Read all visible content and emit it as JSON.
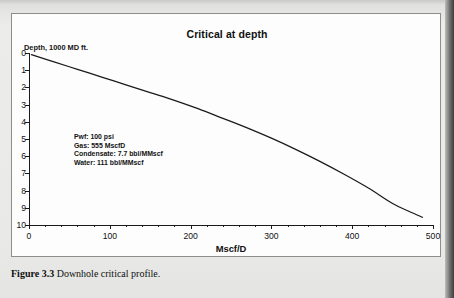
{
  "figure": {
    "caption_label": "Figure 3.3",
    "caption_text": "Downhole critical profile."
  },
  "chart_data": {
    "type": "line",
    "title": "Critical at depth",
    "xlabel": "Mscf/D",
    "ylabel": "Depth, 1000 MD ft.",
    "xlim": [
      0,
      500
    ],
    "ylim": [
      0,
      10
    ],
    "y_inverted": true,
    "grid": false,
    "legend": "none",
    "x_major_ticks": [
      0,
      100,
      200,
      300,
      400,
      500
    ],
    "x_tick_labels": [
      "0",
      "100",
      "200",
      "300",
      "400",
      "500"
    ],
    "x_minor_interval": 20,
    "y_ticks": [
      0,
      1,
      2,
      3,
      4,
      5,
      6,
      7,
      8,
      9,
      10
    ],
    "y_tick_labels": [
      "0",
      "1",
      "2",
      "3",
      "4",
      "5",
      "6",
      "7",
      "8",
      "9",
      "10"
    ],
    "series": [
      {
        "name": "Critical rate profile",
        "color": "#1a1a1a",
        "x": [
          3,
          30,
          60,
          90,
          120,
          150,
          180,
          210,
          240,
          270,
          300,
          330,
          360,
          390,
          420,
          450,
          470,
          487
        ],
        "y": [
          0.1,
          0.5,
          0.95,
          1.4,
          1.85,
          2.3,
          2.75,
          3.25,
          3.8,
          4.35,
          4.95,
          5.6,
          6.3,
          7.05,
          7.85,
          8.75,
          9.2,
          9.55
        ]
      }
    ],
    "annotation_lines": [
      "Pwf: 100 psi",
      "Gas: 555 MscfD",
      "Condensate: 7.7 bbl/MMscf",
      "Water: 111 bbl/MMscf"
    ]
  }
}
